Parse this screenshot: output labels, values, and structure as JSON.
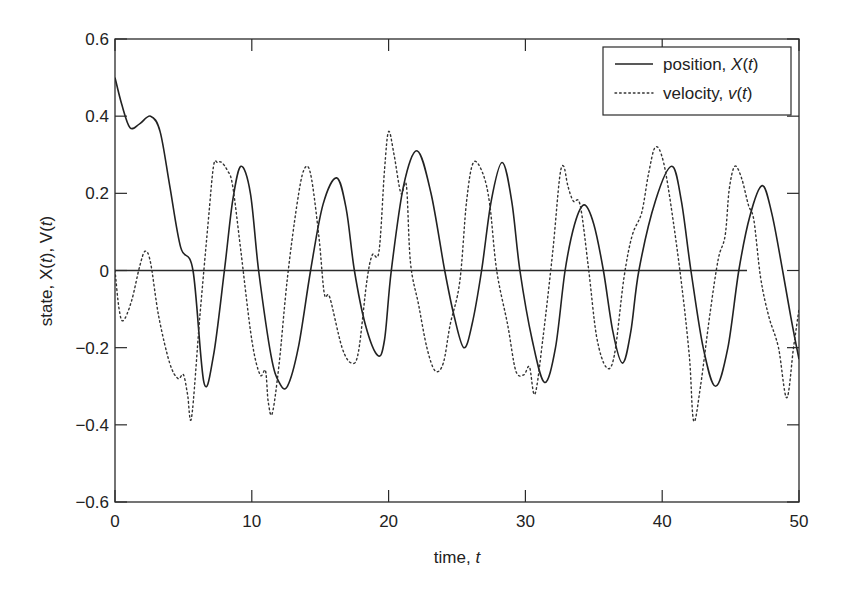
{
  "chart_data": {
    "type": "line",
    "title": "",
    "xlabel": "time, t",
    "ylabel": "state, X(t), V(t)",
    "xlim": [
      0,
      50
    ],
    "ylim": [
      -0.6,
      0.6
    ],
    "x_ticks": [
      0,
      10,
      20,
      30,
      40,
      50
    ],
    "y_ticks": [
      -0.6,
      -0.4,
      -0.2,
      0,
      0.2,
      0.4,
      0.6
    ],
    "x_tick_labels": [
      "0",
      "10",
      "20",
      "30",
      "40",
      "50"
    ],
    "y_tick_labels": [
      "−0.6",
      "−0.4",
      "−0.2",
      "0",
      "0.2",
      "0.4",
      "0.6"
    ],
    "grid": false,
    "legend_position": "upper right",
    "zero_line": {
      "x_start": 0,
      "x_end": 46.2,
      "y": 0
    },
    "series": [
      {
        "name": "position, X(t)",
        "legend_prefix": "position, ",
        "legend_symbol": "X(t)",
        "style": "solid",
        "color": "#222222",
        "x": [
          0,
          0.5,
          1.1,
          1.8,
          2.6,
          3.3,
          4.0,
          4.8,
          5.7,
          6.5,
          7.2,
          8.0,
          8.6,
          9.2,
          9.9,
          10.5,
          11.4,
          12.0,
          12.6,
          13.4,
          14.3,
          15.2,
          16.2,
          16.9,
          17.5,
          18.3,
          19.2,
          19.7,
          20.2,
          21.1,
          22.1,
          23.1,
          24.1,
          24.8,
          25.5,
          26.1,
          26.8,
          27.5,
          28.3,
          29.0,
          29.6,
          30.5,
          31.4,
          32.2,
          32.9,
          33.6,
          34.3,
          35.0,
          35.7,
          36.4,
          37.1,
          37.7,
          38.3,
          39.5,
          40.7,
          41.4,
          42.1,
          43.0,
          43.9,
          44.8,
          45.6,
          46.4,
          47.3,
          48.0,
          48.8,
          49.4,
          50
        ],
        "y": [
          0.5,
          0.43,
          0.37,
          0.38,
          0.4,
          0.36,
          0.22,
          0.06,
          0.0,
          -0.29,
          -0.22,
          0.0,
          0.18,
          0.27,
          0.2,
          0.0,
          -0.22,
          -0.29,
          -0.3,
          -0.2,
          0.0,
          0.17,
          0.24,
          0.16,
          0.0,
          -0.14,
          -0.22,
          -0.18,
          0.0,
          0.22,
          0.31,
          0.2,
          0.0,
          -0.12,
          -0.2,
          -0.14,
          0.0,
          0.18,
          0.28,
          0.18,
          0.0,
          -0.18,
          -0.29,
          -0.2,
          0.0,
          0.12,
          0.17,
          0.12,
          0.0,
          -0.16,
          -0.24,
          -0.16,
          0.0,
          0.18,
          0.27,
          0.18,
          0.0,
          -0.2,
          -0.3,
          -0.2,
          0.0,
          0.14,
          0.22,
          0.15,
          0.0,
          -0.12,
          -0.23
        ]
      },
      {
        "name": "velocity, v(t)",
        "legend_prefix": "velocity, ",
        "legend_symbol": "v(t)",
        "style": "dotted",
        "color": "#333333",
        "x": [
          0,
          0.3,
          0.6,
          1.2,
          1.8,
          2.2,
          2.6,
          3.2,
          4.0,
          4.6,
          5.0,
          5.3,
          5.6,
          6.2,
          6.8,
          7.2,
          7.5,
          7.8,
          8.2,
          8.6,
          9.2,
          10.0,
          10.6,
          11.0,
          11.2,
          11.5,
          12.0,
          12.6,
          13.3,
          13.8,
          14.3,
          14.9,
          15.3,
          15.7,
          16.6,
          17.3,
          17.8,
          18.4,
          18.8,
          19.3,
          19.7,
          20.0,
          20.4,
          20.9,
          21.3,
          21.6,
          22.2,
          22.8,
          23.4,
          24.0,
          24.5,
          25.2,
          25.7,
          26.2,
          26.9,
          27.4,
          27.9,
          28.7,
          29.3,
          29.9,
          30.3,
          30.7,
          31.3,
          32.0,
          32.5,
          32.8,
          33.1,
          33.5,
          34.0,
          34.6,
          35.2,
          35.9,
          36.5,
          37.2,
          37.8,
          38.5,
          39.0,
          39.5,
          40.1,
          40.8,
          41.5,
          42.0,
          42.3,
          42.8,
          43.5,
          44.1,
          44.6,
          44.9,
          45.3,
          45.8,
          46.3,
          46.7,
          47.2,
          47.8,
          48.5,
          49.1,
          49.6,
          50
        ],
        "y": [
          0.0,
          -0.1,
          -0.13,
          -0.08,
          0.01,
          0.05,
          0.02,
          -0.12,
          -0.24,
          -0.28,
          -0.27,
          -0.32,
          -0.38,
          -0.12,
          0.12,
          0.27,
          0.28,
          0.28,
          0.26,
          0.22,
          0.05,
          -0.18,
          -0.27,
          -0.26,
          -0.34,
          -0.37,
          -0.24,
          -0.02,
          0.17,
          0.26,
          0.25,
          0.09,
          -0.06,
          -0.07,
          -0.2,
          -0.24,
          -0.21,
          -0.03,
          0.04,
          0.05,
          0.26,
          0.36,
          0.3,
          0.2,
          0.22,
          0.02,
          -0.09,
          -0.2,
          -0.26,
          -0.24,
          -0.14,
          -0.03,
          0.18,
          0.28,
          0.25,
          0.17,
          0.0,
          -0.14,
          -0.26,
          -0.27,
          -0.25,
          -0.32,
          -0.17,
          0.05,
          0.24,
          0.27,
          0.22,
          0.18,
          0.17,
          0.01,
          -0.17,
          -0.25,
          -0.22,
          -0.02,
          0.09,
          0.15,
          0.25,
          0.32,
          0.28,
          0.13,
          -0.06,
          -0.23,
          -0.39,
          -0.3,
          -0.11,
          0.03,
          0.09,
          0.21,
          0.27,
          0.24,
          0.17,
          0.13,
          -0.02,
          -0.12,
          -0.2,
          -0.33,
          -0.2,
          -0.1
        ]
      }
    ]
  }
}
